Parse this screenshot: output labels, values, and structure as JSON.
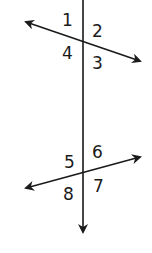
{
  "diagram": {
    "type": "transversal-angles",
    "colors": {
      "line": "#1a1a1a",
      "background": "#ffffff"
    },
    "lines": [
      {
        "id": "transversal",
        "from": [
          83,
          0
        ],
        "to": [
          83,
          232
        ],
        "arrow_end": true
      },
      {
        "id": "line-top",
        "from": [
          25,
          22
        ],
        "to": [
          141,
          61
        ],
        "arrow_start": true,
        "arrow_end": true
      },
      {
        "id": "line-bottom",
        "from": [
          25,
          188
        ],
        "to": [
          141,
          156
        ],
        "arrow_start": true,
        "arrow_end": true
      }
    ],
    "intersections": [
      {
        "id": "top",
        "point": [
          83,
          40
        ]
      },
      {
        "id": "bottom",
        "point": [
          83,
          173
        ]
      }
    ],
    "angle_labels": {
      "a1": "1",
      "a2": "2",
      "a3": "3",
      "a4": "4",
      "a5": "5",
      "a6": "6",
      "a7": "7",
      "a8": "8"
    }
  }
}
